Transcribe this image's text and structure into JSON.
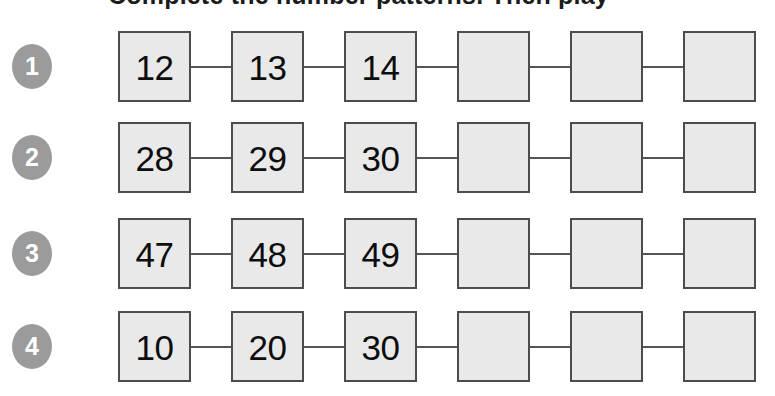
{
  "page": {
    "clipped_header_text": "Complete the number patterns. Then play",
    "background_color": "#ffffff"
  },
  "style": {
    "badge_color": "#9b9b9b",
    "badge_text_color": "#ffffff",
    "box_fill_color": "#e9e9e9",
    "box_border_color": "#4c4c4c",
    "connector_color": "#555555",
    "value_text_color": "#0d0d0d"
  },
  "exercise": {
    "columns_per_row": 6,
    "rows": [
      {
        "number": "1",
        "cells": [
          {
            "value": "12",
            "filled": true
          },
          {
            "value": "13",
            "filled": true
          },
          {
            "value": "14",
            "filled": true
          },
          {
            "value": "",
            "filled": false
          },
          {
            "value": "",
            "filled": false
          },
          {
            "value": "",
            "filled": false
          }
        ]
      },
      {
        "number": "2",
        "cells": [
          {
            "value": "28",
            "filled": true
          },
          {
            "value": "29",
            "filled": true
          },
          {
            "value": "30",
            "filled": true
          },
          {
            "value": "",
            "filled": false
          },
          {
            "value": "",
            "filled": false
          },
          {
            "value": "",
            "filled": false
          }
        ]
      },
      {
        "number": "3",
        "cells": [
          {
            "value": "47",
            "filled": true
          },
          {
            "value": "48",
            "filled": true
          },
          {
            "value": "49",
            "filled": true
          },
          {
            "value": "",
            "filled": false
          },
          {
            "value": "",
            "filled": false
          },
          {
            "value": "",
            "filled": false
          }
        ]
      },
      {
        "number": "4",
        "cells": [
          {
            "value": "10",
            "filled": true
          },
          {
            "value": "20",
            "filled": true
          },
          {
            "value": "30",
            "filled": true
          },
          {
            "value": "",
            "filled": false
          },
          {
            "value": "",
            "filled": false
          },
          {
            "value": "",
            "filled": false
          }
        ]
      }
    ]
  }
}
